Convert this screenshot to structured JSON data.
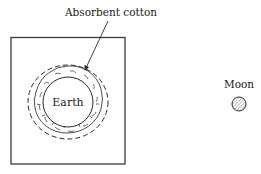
{
  "diagram": {
    "labels": {
      "cotton": "Absorbent cotton",
      "earth": "Earth",
      "moon": "Moon"
    },
    "colors": {
      "stroke": "#2a2a2a",
      "moon_fill": "#c9c9c9",
      "background": "#ffffff"
    }
  }
}
